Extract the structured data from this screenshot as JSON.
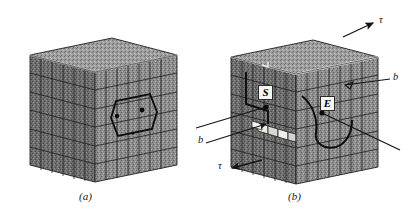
{
  "figure": {
    "background_color": "#ffffff",
    "ink_color": "#1a1a1a",
    "panels": [
      {
        "id": "a",
        "caption": "(a)",
        "description": "Cube of crystal lattice containing a dislocation loop inside, before shear",
        "cube": {
          "top_face_tone": "#9a9a9a",
          "front_face_tone": "#8b8b8b",
          "side_face_tone": "#6d6d6d",
          "grid_columns": 8,
          "grid_rows": 6
        },
        "markers": [
          {
            "name": "loop-node-left",
            "type": "dot"
          },
          {
            "name": "loop-node-right",
            "type": "dot"
          }
        ]
      },
      {
        "id": "b",
        "caption": "(b)",
        "description": "Same cube after the dislocation has swept through, leaving a slip step; screw segment S and edge segment E are marked",
        "cube": {
          "top_face_tone": "#9a9a9a",
          "front_face_tone": "#8b8b8b",
          "side_face_tone": "#6d6d6d",
          "grid_columns": 8,
          "grid_rows": 6
        },
        "markers": [
          {
            "name": "screw-segment",
            "label": "S",
            "type": "boxed-label"
          },
          {
            "name": "edge-segment",
            "label": "E",
            "type": "boxed-label"
          }
        ]
      }
    ],
    "annotations": [
      {
        "name": "shear-stress-top",
        "label": "τ",
        "symbol": "tau",
        "arrow": "up-right",
        "panel": "b"
      },
      {
        "name": "shear-stress-bottom",
        "label": "τ",
        "symbol": "tau",
        "arrow": "left",
        "panel": "b"
      },
      {
        "name": "burgers-vector-right",
        "label": "b",
        "symbol": "b",
        "arrow": "left",
        "panel": "b"
      },
      {
        "name": "burgers-vector-left",
        "label": "b",
        "symbol": "b",
        "arrow": "up-right",
        "panel": "b"
      }
    ]
  }
}
